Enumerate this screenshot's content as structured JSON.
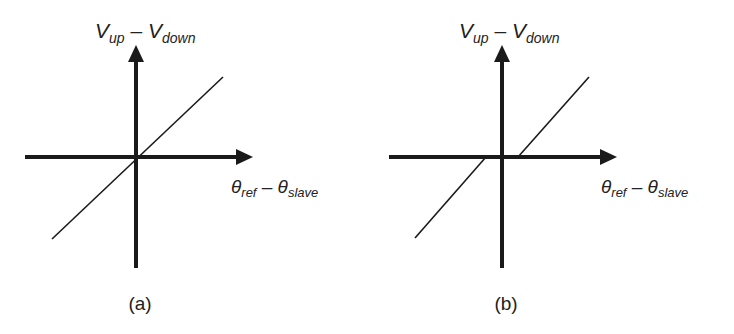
{
  "figure": {
    "stroke_color": "#1a1a1a",
    "panels": [
      {
        "id": "a",
        "caption": "(a)",
        "y_axis_label": {
          "main": "V",
          "sub1": "up",
          "minus": " – ",
          "main2": "V",
          "sub2": "down"
        },
        "x_axis_label": {
          "main": "θ",
          "sub1": "ref",
          "minus": " – ",
          "main2": "θ",
          "sub2": "slave"
        },
        "characteristic": "linear through origin, no dead zone"
      },
      {
        "id": "b",
        "caption": "(b)",
        "y_axis_label": {
          "main": "V",
          "sub1": "up",
          "minus": " – ",
          "main2": "V",
          "sub2": "down"
        },
        "x_axis_label": {
          "main": "θ",
          "sub1": "ref",
          "minus": " – ",
          "main2": "θ",
          "sub2": "slave"
        },
        "characteristic": "linear with dead zone around origin"
      }
    ]
  }
}
